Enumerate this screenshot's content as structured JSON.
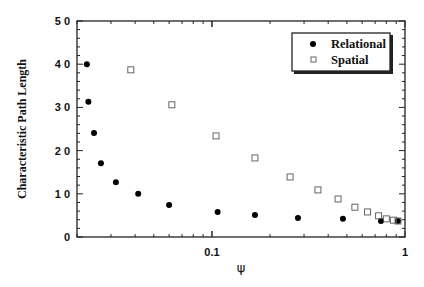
{
  "chart_data": {
    "type": "scatter",
    "title": "",
    "xlabel": "ψ",
    "ylabel": "Characteristic Path Length",
    "xscale": "log",
    "xlim": [
      0.02,
      1
    ],
    "ylim": [
      0,
      50
    ],
    "x_ticks": [
      {
        "value": 0.1,
        "label": "0.1"
      },
      {
        "value": 1,
        "label": "1"
      }
    ],
    "y_ticks": [
      {
        "value": 0,
        "label": "0"
      },
      {
        "value": 10,
        "label": "1 0"
      },
      {
        "value": 20,
        "label": "2 0"
      },
      {
        "value": 30,
        "label": "3 0"
      },
      {
        "value": 40,
        "label": "4 0"
      },
      {
        "value": 50,
        "label": "5 0"
      }
    ],
    "grid": false,
    "legend_position": "upper right",
    "series": [
      {
        "name": "Relational",
        "marker": "filled-circle",
        "color": "#000000",
        "x": [
          0.0225,
          0.0229,
          0.0245,
          0.0266,
          0.0318,
          0.0415,
          0.06,
          0.107,
          0.167,
          0.279,
          0.477,
          0.751,
          0.92
        ],
        "y": [
          40.0,
          31.3,
          24.1,
          17.1,
          12.7,
          10.0,
          7.4,
          5.8,
          5.1,
          4.4,
          4.2,
          3.7,
          3.7
        ]
      },
      {
        "name": "Spatial",
        "marker": "open-square",
        "color": "#555555",
        "x": [
          0.038,
          0.062,
          0.105,
          0.167,
          0.254,
          0.354,
          0.45,
          0.55,
          0.64,
          0.73,
          0.8,
          0.87,
          0.92
        ],
        "y": [
          38.7,
          30.6,
          23.4,
          18.3,
          13.9,
          10.9,
          8.8,
          6.9,
          5.8,
          4.9,
          4.2,
          3.9,
          3.7
        ]
      }
    ]
  },
  "legend": {
    "items": [
      {
        "label": "Relational"
      },
      {
        "label": "Spatial"
      }
    ]
  }
}
